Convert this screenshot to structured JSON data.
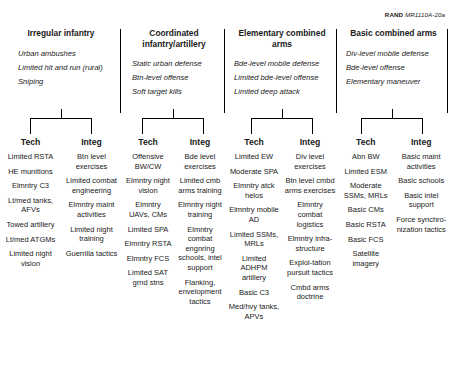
{
  "credit": {
    "publisher": "RAND",
    "document_id": "MR1110A-20a"
  },
  "columns": [
    {
      "title": "Irregular infantry",
      "missions": [
        "Urban ambushes",
        "Limited hit and run (rural)",
        "Sniping"
      ],
      "sub": [
        {
          "label": "Tech",
          "items": [
            "Limited RSTA",
            "HE munitions",
            "Elmntry C3",
            "Lt/med tanks, AFVs",
            "Towed artillery",
            "Lt/med ATGMs",
            "Limited night vision"
          ]
        },
        {
          "label": "Integ",
          "items": [
            "Btn level exercises",
            "Limited combat engineering",
            "Elmntry maint activities",
            "Limited night training",
            "Guerrilla tactics"
          ]
        }
      ]
    },
    {
      "title": "Coordinated infantry/artillery",
      "missions": [
        "Static urban defense",
        "Btn-level offense",
        "Soft target kills"
      ],
      "sub": [
        {
          "label": "Tech",
          "items": [
            "Offensive BW/CW",
            "Elmntry night vision",
            "Elmntry UAVs, CMs",
            "Limited SPA",
            "Elmntry RSTA",
            "Elmntry FCS",
            "Limited SAT grnd stns"
          ]
        },
        {
          "label": "Integ",
          "items": [
            "Bde level exercises",
            "Limited cmb arms training",
            "Elmntry night training",
            "Elmntry combat engnring schools, intel support",
            "Flanking, envelopment tactics"
          ]
        }
      ]
    },
    {
      "title": "Elementary combined arms",
      "missions": [
        "Bde-level mobile defense",
        "Limited bde-level offense",
        "Limited deep attack"
      ],
      "sub": [
        {
          "label": "Tech",
          "items": [
            "Limited EW",
            "Moderate SPA",
            "Elmntry atck helos",
            "Elmntry mobile AD",
            "Limited SSMs, MRLs",
            "Limited ADHPM artillery",
            "Basic C3",
            "Med/hvy tanks, APVs"
          ]
        },
        {
          "label": "Integ",
          "items": [
            "Div level exercises",
            "Btn level cmbd arms exercises",
            "Elmntry combat logistics",
            "Elmntry infra-structure",
            "Exploi-tation pursuit tactics",
            "Cmbd arms doctrine"
          ]
        }
      ]
    },
    {
      "title": "Basic combined arms",
      "missions": [
        "Div-level mobile defense",
        "Bde-level offense",
        "Elementary maneuver"
      ],
      "sub": [
        {
          "label": "Tech",
          "items": [
            "Abn BW",
            "Limited ESM",
            "Moderate SSMs, MRLs",
            "Basic CMs",
            "Basic RSTA",
            "Basic FCS",
            "Satellite imagery"
          ]
        },
        {
          "label": "Integ",
          "items": [
            "Basic maint activities",
            "Basic schools",
            "Basic intel support",
            "Force synchro-nization tactics"
          ]
        }
      ]
    }
  ]
}
